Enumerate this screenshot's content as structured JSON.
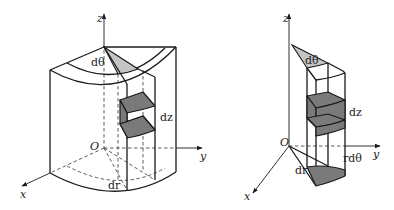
{
  "figures": [
    {
      "id": "left",
      "description": "Cylindrical sector with volume element in cylindrical coordinates",
      "labels": {
        "z_axis": "z",
        "y_axis": "y",
        "x_axis": "x",
        "origin": "O",
        "d_theta": "dθ",
        "d_z": "dz",
        "d_r": "dr"
      }
    },
    {
      "id": "right",
      "description": "Isolated cylindrical volume element column",
      "labels": {
        "z_axis": "z",
        "y_axis": "y",
        "x_axis": "x",
        "origin": "O",
        "d_theta": "dθ",
        "d_z": "dz",
        "d_r": "dr",
        "r_d_theta": "rdθ"
      }
    }
  ],
  "colors": {
    "line": "#1a1a1a",
    "shade_dark": "#7a7a7a",
    "shade_light": "#c4c4c4",
    "background": "#ffffff"
  }
}
